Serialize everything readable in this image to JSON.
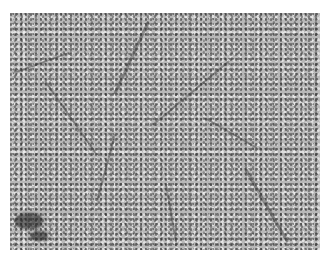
{
  "image": {
    "description": "Grayscale histology micrograph showing densely packed cells arranged in sheets/trabeculae separated by thin dark fibrovascular septa",
    "colors": {
      "background": "#ffffff",
      "tissue_mid": "#b8b8b8",
      "nuclei": "#303030",
      "septa": "#373737"
    }
  }
}
